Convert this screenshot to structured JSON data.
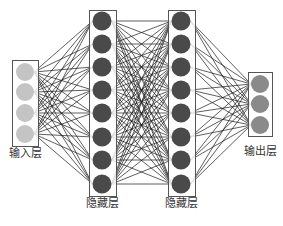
{
  "diagram": {
    "title": "",
    "type": "fully-connected neural network",
    "edge_color": "#1a1a1a",
    "box_color": "#555555",
    "layers": [
      {
        "id": "input",
        "label": "输入层",
        "nodes": 4,
        "cx": 25,
        "node_y": [
          72,
          92,
          113,
          134
        ],
        "radius": 9,
        "fill": "#c4c4c4",
        "box": {
          "x": 12,
          "y": 60,
          "w": 26,
          "h": 86
        },
        "label_pos": {
          "x": 25,
          "y": 154
        }
      },
      {
        "id": "hidden1",
        "label": "隐藏层",
        "nodes": 8,
        "cx": 102,
        "node_y": [
          21,
          44,
          67,
          90,
          113,
          137,
          160,
          184
        ],
        "radius": 9.5,
        "fill": "#4a4a4a",
        "box": {
          "x": 89,
          "y": 10,
          "w": 27,
          "h": 186
        },
        "label_pos": {
          "x": 102,
          "y": 204
        }
      },
      {
        "id": "hidden2",
        "label": "隐藏层",
        "nodes": 8,
        "cx": 181,
        "node_y": [
          21,
          44,
          67,
          90,
          113,
          137,
          160,
          184
        ],
        "radius": 9.5,
        "fill": "#4a4a4a",
        "box": {
          "x": 168,
          "y": 10,
          "w": 27,
          "h": 186
        },
        "label_pos": {
          "x": 181,
          "y": 204
        }
      },
      {
        "id": "output",
        "label": "输出层",
        "nodes": 3,
        "cx": 260,
        "node_y": [
          84,
          104,
          125
        ],
        "radius": 9,
        "fill": "#8a8a8a",
        "box": {
          "x": 248,
          "y": 72,
          "w": 24,
          "h": 64
        },
        "label_pos": {
          "x": 260,
          "y": 152
        }
      }
    ]
  }
}
